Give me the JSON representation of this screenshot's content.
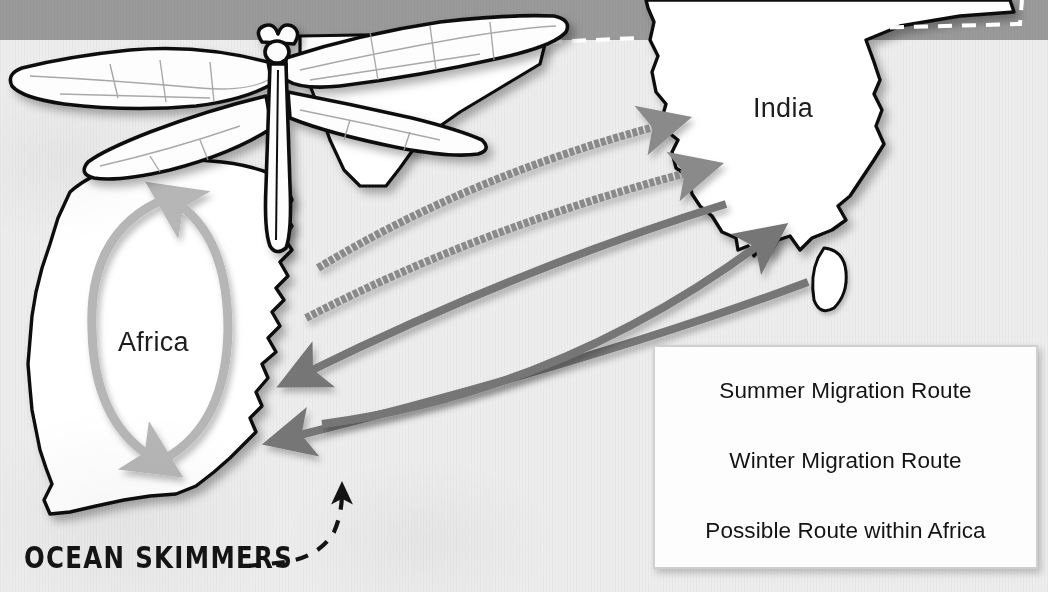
{
  "canvas": {
    "width": 1048,
    "height": 592
  },
  "colors": {
    "background": "#ededed",
    "top_band": "#9a9a9a",
    "land_fill": "#ffffff",
    "land_outline": "#0d0d0d",
    "summer_arrow": "#8a8a8a",
    "winter_arrow": "#767676",
    "possible_arrow": "#b6b6b6",
    "legend_border": "#cfcfcf",
    "legend_fill": "#fdfdfd",
    "text": "#141414"
  },
  "map": {
    "labels": [
      {
        "name": "africa",
        "text": "Africa"
      },
      {
        "name": "india",
        "text": "India"
      }
    ],
    "landmasses": [
      {
        "name": "africa",
        "label": "Africa"
      },
      {
        "name": "india",
        "label": "India"
      },
      {
        "name": "sri-lanka",
        "label": ""
      },
      {
        "name": "arabia",
        "label": ""
      }
    ],
    "boundary_line_style": "white-dashed"
  },
  "illustration": {
    "name": "dragonfly",
    "description": "Ocean Skimmer dragonfly line drawing"
  },
  "caption": {
    "text": "OCEAN SKIMMERS",
    "pointer": "dashed-curved-arrow"
  },
  "routes": [
    {
      "name": "summer-route-north",
      "type": "summer",
      "from": "Africa",
      "to": "India",
      "direction": "eastbound"
    },
    {
      "name": "summer-route-mid",
      "type": "summer",
      "from": "Africa",
      "to": "India",
      "direction": "eastbound"
    },
    {
      "name": "winter-route-south",
      "type": "winter",
      "from": "Africa",
      "to": "India",
      "direction": "eastbound"
    },
    {
      "name": "winter-route-return-north",
      "type": "winter",
      "from": "India",
      "to": "Africa",
      "direction": "westbound"
    },
    {
      "name": "winter-route-return-south",
      "type": "winter",
      "from": "India",
      "to": "Africa",
      "direction": "westbound"
    },
    {
      "name": "possible-route-africa-loop",
      "type": "possible",
      "from": "Africa",
      "to": "Africa",
      "direction": "clockwise-loop"
    },
    {
      "name": "possible-route-equatorial",
      "type": "possible",
      "from": "India",
      "to": "Africa",
      "direction": "westbound"
    }
  ],
  "legend": {
    "name": "migration-legend",
    "items": [
      {
        "key": "summer",
        "label": "Summer Migration Route",
        "color": "#8a8a8a",
        "style": "textured"
      },
      {
        "key": "winter",
        "label": "Winter Migration Route",
        "color": "#767676",
        "style": "solid"
      },
      {
        "key": "possible",
        "label": "Possible Route within Africa",
        "color": "#b6b6b6",
        "style": "textured"
      }
    ]
  }
}
